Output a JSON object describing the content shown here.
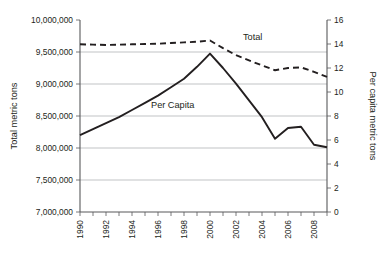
{
  "chart_data": {
    "type": "line",
    "title": "",
    "subtitle": "",
    "xlabel": "",
    "ylabel": "Total metric tons",
    "y2label": "Per capita metric tons",
    "grid": true,
    "legend_position": "inline-annotation",
    "x": [
      1990,
      1991,
      1992,
      1993,
      1994,
      1995,
      1996,
      1997,
      1998,
      1999,
      2000,
      2001,
      2002,
      2003,
      2004,
      2005,
      2006,
      2007,
      2008,
      2009
    ],
    "xtick_labels": [
      "1990",
      "1992",
      "1994",
      "1996",
      "1998",
      "2000",
      "2002",
      "2004",
      "2006",
      "2008"
    ],
    "xtick_values": [
      1990,
      1992,
      1994,
      1996,
      1998,
      2000,
      2002,
      2004,
      2006,
      2008
    ],
    "ylim": [
      7000000,
      10000000
    ],
    "ytick_labels": [
      "7,000,000",
      "7,500,000",
      "8,000,000",
      "8,500,000",
      "9,000,000",
      "9,500,000",
      "10,000,000"
    ],
    "ytick_values": [
      7000000,
      7500000,
      8000000,
      8500000,
      9000000,
      9500000,
      10000000
    ],
    "y2lim": [
      0,
      16
    ],
    "y2tick_labels": [
      "0",
      "2",
      "4",
      "6",
      "8",
      "10",
      "12",
      "14",
      "16"
    ],
    "y2tick_values": [
      0,
      2,
      4,
      6,
      8,
      10,
      12,
      14,
      16
    ],
    "series": [
      {
        "name": "Total",
        "axis": "left",
        "style": "dashed",
        "color": "#231f20",
        "label_text": "Total",
        "values": [
          9620000,
          9615000,
          9610000,
          9615000,
          9620000,
          9625000,
          9630000,
          9640000,
          9650000,
          9660000,
          9680000,
          9560000,
          9450000,
          9370000,
          9290000,
          9215000,
          9250000,
          9260000,
          9190000,
          9110000
        ]
      },
      {
        "name": "Per Capita",
        "axis": "right",
        "style": "solid",
        "color": "#231f20",
        "label_text": "Per Capita",
        "values": [
          6.4,
          6.9,
          7.4,
          7.9,
          8.5,
          9.1,
          9.7,
          10.4,
          11.1,
          12.1,
          13.2,
          12.0,
          10.7,
          9.3,
          7.9,
          6.1,
          7.0,
          7.1,
          5.6,
          5.4
        ]
      }
    ]
  },
  "annotations": {
    "total_label": "Total",
    "percapita_label": "Per Capita"
  },
  "axes": {
    "left_title": "Total metric tons",
    "right_title": "Per capita metric tons"
  }
}
